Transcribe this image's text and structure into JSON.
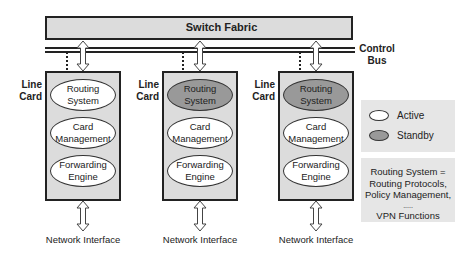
{
  "switch_fabric": {
    "label": "Switch Fabric"
  },
  "control_bus": {
    "label_line1": "Control",
    "label_line2": "Bus"
  },
  "line_cards": [
    {
      "label_line1": "Line",
      "label_line2": "Card",
      "modules": [
        {
          "line1": "Routing",
          "line2": "System",
          "state": "active"
        },
        {
          "line1": "Card",
          "line2": "Management",
          "state": "active"
        },
        {
          "line1": "Forwarding",
          "line2": "Engine",
          "state": "active"
        }
      ],
      "interface_label": "Network Interface"
    },
    {
      "label_line1": "Line",
      "label_line2": "Card",
      "modules": [
        {
          "line1": "Routing",
          "line2": "System",
          "state": "standby"
        },
        {
          "line1": "Card",
          "line2": "Management",
          "state": "active"
        },
        {
          "line1": "Forwarding",
          "line2": "Engine",
          "state": "active"
        }
      ],
      "interface_label": "Network Interface"
    },
    {
      "label_line1": "Line",
      "label_line2": "Card",
      "modules": [
        {
          "line1": "Routing",
          "line2": "System",
          "state": "standby"
        },
        {
          "line1": "Card",
          "line2": "Management",
          "state": "active"
        },
        {
          "line1": "Forwarding",
          "line2": "Engine",
          "state": "active"
        }
      ],
      "interface_label": "Network Interface"
    }
  ],
  "legend": {
    "items": [
      {
        "label": "Active",
        "color": "#ffffff"
      },
      {
        "label": "Standby",
        "color": "#999999"
      }
    ]
  },
  "note": {
    "lines": [
      "Routing System =",
      "Routing Protocols,",
      "Policy Management,",
      ".....",
      "VPN Functions"
    ]
  },
  "colors": {
    "card_fill": "#dcdcdc",
    "standby": "#999999",
    "active": "#ffffff",
    "panel": "#e6e6e6"
  }
}
